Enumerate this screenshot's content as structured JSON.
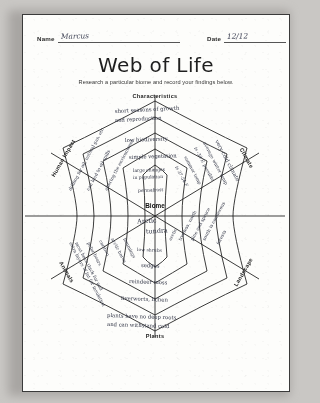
{
  "header": {
    "name_label": "Name",
    "name_value": "Marcus",
    "date_label": "Date",
    "date_value": "12/12"
  },
  "title": "Web of Life",
  "subtitle": "Research a particular biome and record your findings below.",
  "center": {
    "label": "Biome",
    "value_line1": "Arctic",
    "value_line2": "tundra"
  },
  "sectors": [
    {
      "name": "characteristics",
      "label": "Characteristics",
      "entries": [
        "short seasons of growth",
        "and reproduction",
        "low biodiversity",
        "simple vegetation",
        "large changes",
        "in population",
        "permafrost"
      ]
    },
    {
      "name": "climate",
      "label": "Climate",
      "entries": [
        "very cold climate",
        "average winter temp",
        "is -30 F, possible",
        "summer temp",
        "is 37-54 F"
      ]
    },
    {
      "name": "landscape",
      "label": "Landscape",
      "entries": [
        "arctic",
        "treeless, north",
        "pine and spruce",
        "south is coniferous",
        "forests"
      ]
    },
    {
      "name": "plants",
      "label": "Plants",
      "entries": [
        "low shrubs",
        "sedges",
        "reindeer moss",
        "liverworts, lichen",
        "plants have no deep roots",
        "and can withstand cold"
      ]
    },
    {
      "name": "animals",
      "label": "Animals",
      "entries": [
        "lemmings",
        "arctic hares",
        "caribou",
        "polar bears",
        "most have thick fur and",
        "extra layers of fat for insulation"
      ]
    },
    {
      "name": "human-impact",
      "label": "Human Impact",
      "entries": [
        "drilling for oil, natural gas, etc",
        "can lead to oil spills",
        "altering the environment"
      ]
    }
  ]
}
